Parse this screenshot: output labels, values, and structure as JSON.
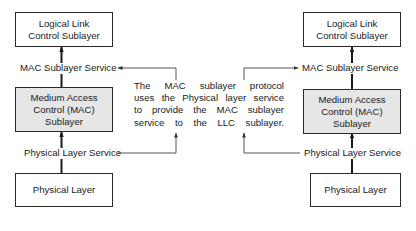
{
  "diagram": {
    "left_stack": {
      "llc_box": {
        "line1": "Logical Link",
        "line2": "Control Sublayer"
      },
      "mac_service_label": "MAC Sublayer Service",
      "mac_box": {
        "line1": "Medium Access",
        "line2": "Control (MAC)",
        "line3": "Sublayer"
      },
      "physical_service_label": "Physical Layer Service",
      "physical_box": {
        "line1": "Physical Layer"
      }
    },
    "right_stack": {
      "llc_box": {
        "line1": "Logical Link",
        "line2": "Control Sublayer"
      },
      "mac_service_label": "MAC Sublayer Service",
      "mac_box": {
        "line1": "Medium Access",
        "line2": "Control (MAC)",
        "line3": "Sublayer"
      },
      "physical_service_label": "Physical Layer Service",
      "physical_box": {
        "line1": "Physical Layer"
      }
    },
    "description": {
      "line1": "The MAC sublayer protocol",
      "line2": "uses the Physical layer service",
      "line3": "to provide the MAC sublayer",
      "line4": "service to the LLC sublayer."
    },
    "colors": {
      "line": "#2a2a2a",
      "connector": "#555555",
      "mac_box_fill": "#e6e6e6",
      "box_fill": "#ffffff"
    }
  }
}
